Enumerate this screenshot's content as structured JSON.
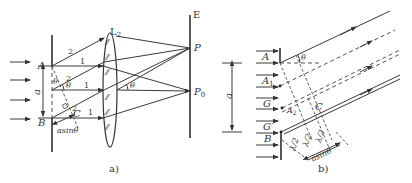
{
  "figure": {
    "panel_a": {
      "caption": "a)",
      "lens_label": "L",
      "lens_sub": "2",
      "screen_label": "E",
      "point_P": "P",
      "point_P0": "P",
      "point_P0_sub": "0",
      "slit_top": "A",
      "slit_bottom": "B",
      "width_label": "a",
      "point_C": "C",
      "path_diff": "asinθ",
      "ray1": "1",
      "ray2": "2",
      "angle": "θ"
    },
    "panel_b": {
      "caption": "b)",
      "labels": [
        "A",
        "A",
        "G",
        "G",
        "B"
      ],
      "label_subs": [
        "",
        "1",
        "",
        "′",
        ""
      ],
      "width_label": "a",
      "angle": "θ",
      "point_C": "C",
      "point_A2": "A",
      "point_A2_sub": "2",
      "half_wave": "λ/2",
      "path_diff": "asinθ"
    }
  }
}
